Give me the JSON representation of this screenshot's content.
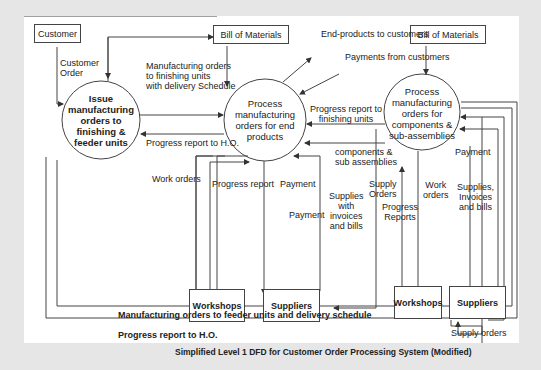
{
  "diagram": {
    "caption": "Simplified Level 1 DFD for Customer Order Processing System (Modified)",
    "entities": {
      "customer": "Customer",
      "bom_left": "Bill of Materials",
      "bom_right": "Bill of Materials",
      "workshops_mid": "Workshops",
      "suppliers_mid": "Suppliers",
      "workshops_right": "Workshops",
      "suppliers_right": "Suppliers"
    },
    "processes": {
      "p1": [
        "Issue",
        "manufacturing",
        "orders to",
        "finishing &",
        "feeder units"
      ],
      "p2": [
        "Process",
        "manufacturing",
        "orders for end",
        "products"
      ],
      "p3": [
        "Process",
        "manufacturing",
        "orders for",
        "components &",
        "sub-assemblies"
      ]
    },
    "flows": {
      "customer_order": [
        "Customer",
        "Order"
      ],
      "mfg_orders_finishing": [
        "Manufacturing orders",
        "to finishing units",
        "with delivery Schedule"
      ],
      "progress_ho_mid": "Progress report to H.O.",
      "end_products": "End-products to customers",
      "payments_customers": "Payments from customers",
      "progress_finishing": [
        "Progress report to",
        "finishing units"
      ],
      "components": [
        "components &",
        "sub assemblies"
      ],
      "work_orders_mid": "Work orders",
      "progress_report_mid": "Progress report",
      "payment_mid_1": "Payment",
      "payment_mid_2": "Payment",
      "supplies_invoices_mid": [
        "Supplies",
        "with",
        "invoices",
        "and bills"
      ],
      "supply_orders_mid": [
        "Supply",
        "Orders"
      ],
      "progress_reports_right": [
        "Progress",
        "Reports"
      ],
      "work_orders_right": [
        "Work",
        "orders"
      ],
      "payment_right": "Payment",
      "supplies_invoices_right": [
        "Supplies,",
        "Invoices",
        "and bills"
      ],
      "supply_orders_right": "Supply orders",
      "mfg_orders_feeder": "Manufacturing orders to feeder units and delivery schedule",
      "progress_ho_bottom": "Progress report to H.O."
    }
  }
}
